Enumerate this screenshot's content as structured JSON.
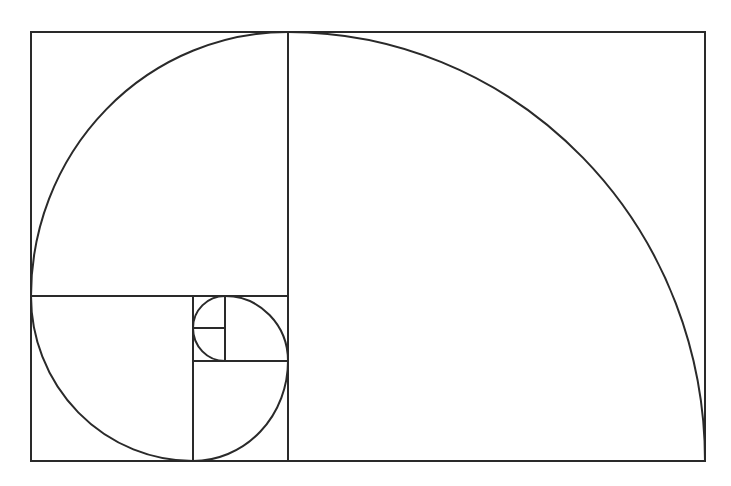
{
  "diagram": {
    "stroke_color": "#2a2a2a",
    "background": "#ffffff",
    "outer_rect": {
      "x": 31,
      "y": 32,
      "w": 674,
      "h": 429
    },
    "lines": [
      {
        "x1": 288,
        "y1": 32,
        "x2": 288,
        "y2": 461
      },
      {
        "x1": 31,
        "y1": 296,
        "x2": 288,
        "y2": 296
      },
      {
        "x1": 193,
        "y1": 296,
        "x2": 193,
        "y2": 461
      },
      {
        "x1": 193,
        "y1": 361,
        "x2": 288,
        "y2": 361
      },
      {
        "x1": 225,
        "y1": 296,
        "x2": 225,
        "y2": 361
      },
      {
        "x1": 193,
        "y1": 328,
        "x2": 225,
        "y2": 328
      }
    ],
    "spiral_path": "M705,461 A417,429 0 0 0 288,32 A257,264 0 0 0 31,296 A162,165 0 0 0 193,461 A95,100 0 0 0 288,361 A63,65 0 0 0 225,296 A32,32 0 0 0 193,328 A32,33 0 0 0 225,361"
  }
}
